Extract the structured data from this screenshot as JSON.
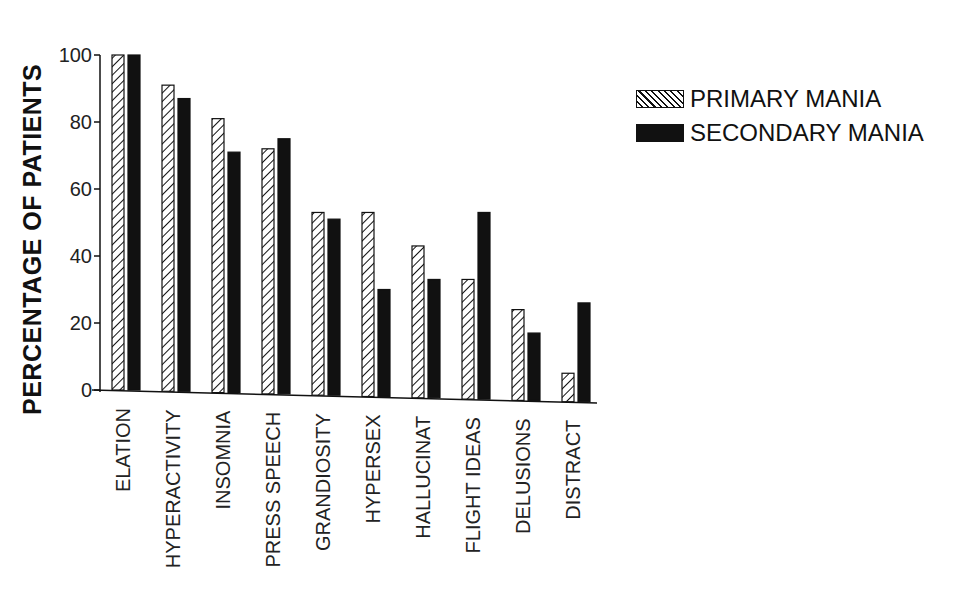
{
  "chart_data": {
    "type": "bar",
    "title": "",
    "xlabel": "",
    "ylabel": "PERCENTAGE OF PATIENTS",
    "ylim": [
      0,
      100
    ],
    "yticks": [
      0,
      20,
      40,
      60,
      80,
      100
    ],
    "grid": false,
    "legend_position": "right",
    "categories": [
      "ELATION",
      "HYPERACTIVITY",
      "INSOMNIA",
      "PRESS SPEECH",
      "GRANDIOSITY",
      "HYPERSEX",
      "HALLUCINAT",
      "FLIGHT IDEAS",
      "DELUSIONS",
      "DISTRACT"
    ],
    "series": [
      {
        "name": "PRIMARY MANIA",
        "pattern": "hatched",
        "values": [
          100,
          91,
          81,
          72,
          53,
          53,
          43,
          33,
          24,
          5
        ]
      },
      {
        "name": "SECONDARY MANIA",
        "pattern": "solid",
        "color": "#111111",
        "values": [
          100,
          87,
          71,
          75,
          51,
          30,
          33,
          53,
          17,
          26
        ]
      }
    ]
  },
  "legend": {
    "primary_label": "PRIMARY MANIA",
    "secondary_label": "SECONDARY MANIA"
  },
  "axis": {
    "ylabel": "PERCENTAGE OF PATIENTS"
  }
}
